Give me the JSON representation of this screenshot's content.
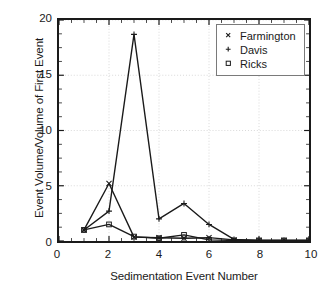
{
  "chart_data": {
    "type": "line",
    "title": "",
    "xlabel": "Sedimentation Event Number",
    "ylabel": "Event Volume/Volume of First Event",
    "xlim": [
      0,
      10
    ],
    "ylim": [
      0,
      20
    ],
    "xticks": [
      0,
      2,
      4,
      6,
      8,
      10
    ],
    "yticks": [
      0,
      5,
      10,
      15,
      20
    ],
    "grid": true,
    "legend_position": "top-right",
    "x": [
      1,
      2,
      3,
      4,
      5,
      6,
      7,
      8,
      9,
      10
    ],
    "series": [
      {
        "name": "Farmington",
        "marker": "x",
        "values": [
          1.0,
          5.2,
          0.35,
          0.3,
          0.25,
          0.3,
          0.1,
          0.05,
          0.05,
          0.05
        ]
      },
      {
        "name": "Davis",
        "marker": "+",
        "values": [
          1.0,
          2.7,
          18.7,
          2.0,
          3.4,
          1.5,
          0.15,
          0.05,
          0.05,
          0.05
        ]
      },
      {
        "name": "Ricks",
        "marker": "square",
        "values": [
          1.0,
          1.5,
          0.4,
          0.25,
          0.55,
          0.1,
          0.05,
          0.05,
          0.05,
          0.05
        ]
      }
    ]
  },
  "axes": {
    "y_title": "Event Volume/Volume of First Event",
    "x_title": "Sedimentation Event Number",
    "y_tick_labels": [
      "20",
      "15",
      "10",
      "5",
      "0"
    ],
    "x_tick_labels": [
      "0",
      "2",
      "4",
      "6",
      "8",
      "10"
    ]
  },
  "legend": {
    "entries": [
      {
        "label": "Farmington",
        "marker_name": "x-marker-icon"
      },
      {
        "label": "Davis",
        "marker_name": "plus-marker-icon"
      },
      {
        "label": "Ricks",
        "marker_name": "square-marker-icon"
      }
    ]
  },
  "style": {
    "line_color": "#1a1a1a",
    "frame_color": "#1a1a1a",
    "grid_color": "#d8d8d8",
    "background": "#ffffff"
  }
}
